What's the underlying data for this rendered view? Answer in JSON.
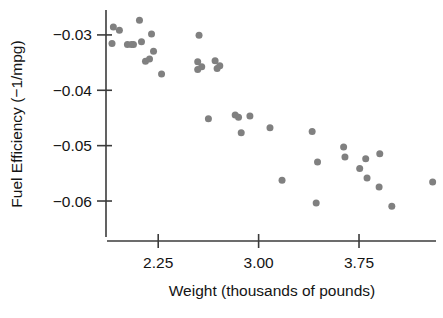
{
  "chart_data": {
    "type": "scatter",
    "title": "",
    "xlabel": "Weight (thousands of pounds)",
    "ylabel": "Fuel Efficiency (−1/mpg)",
    "xlim": [
      1.86,
      4.34
    ],
    "ylim": [
      -0.0665,
      -0.0255
    ],
    "grid": false,
    "legend": null,
    "xticks": [
      2.25,
      3.0,
      3.75
    ],
    "xtick_labels": [
      "2.25",
      "3.00",
      "3.75"
    ],
    "yticks": [
      -0.03,
      -0.04,
      -0.05,
      -0.06
    ],
    "ytick_labels": [
      "−0.03",
      "−0.04",
      "−0.05",
      "−0.06"
    ],
    "marker": {
      "shape": "circle",
      "color": "#808080",
      "size": 5.6
    },
    "points": [
      {
        "x": 1.915,
        "y": -0.02855
      },
      {
        "x": 1.96,
        "y": -0.02915
      },
      {
        "x": 2.11,
        "y": -0.02735
      },
      {
        "x": 1.905,
        "y": -0.03155
      },
      {
        "x": 2.02,
        "y": -0.03175
      },
      {
        "x": 2.065,
        "y": -0.03175
      },
      {
        "x": 2.125,
        "y": -0.03125
      },
      {
        "x": 2.2,
        "y": -0.02985
      },
      {
        "x": 2.05,
        "y": -0.03175
      },
      {
        "x": 2.155,
        "y": -0.03475
      },
      {
        "x": 2.185,
        "y": -0.03435
      },
      {
        "x": 2.215,
        "y": -0.03295
      },
      {
        "x": 2.275,
        "y": -0.03705
      },
      {
        "x": 2.555,
        "y": -0.03005
      },
      {
        "x": 2.545,
        "y": -0.03485
      },
      {
        "x": 2.545,
        "y": -0.03625
      },
      {
        "x": 2.575,
        "y": -0.03575
      },
      {
        "x": 2.675,
        "y": -0.03465
      },
      {
        "x": 2.69,
        "y": -0.03605
      },
      {
        "x": 2.71,
        "y": -0.03555
      },
      {
        "x": 2.625,
        "y": -0.04515
      },
      {
        "x": 2.825,
        "y": -0.04445
      },
      {
        "x": 2.85,
        "y": -0.04485
      },
      {
        "x": 2.935,
        "y": -0.04465
      },
      {
        "x": 2.87,
        "y": -0.04765
      },
      {
        "x": 3.085,
        "y": -0.04675
      },
      {
        "x": 3.4,
        "y": -0.04745
      },
      {
        "x": 3.635,
        "y": -0.05025
      },
      {
        "x": 3.645,
        "y": -0.05205
      },
      {
        "x": 3.44,
        "y": -0.05295
      },
      {
        "x": 3.175,
        "y": -0.05625
      },
      {
        "x": 3.755,
        "y": -0.05415
      },
      {
        "x": 3.43,
        "y": -0.06035
      },
      {
        "x": 3.8,
        "y": -0.05235
      },
      {
        "x": 3.905,
        "y": -0.05145
      },
      {
        "x": 3.81,
        "y": -0.05585
      },
      {
        "x": 3.9,
        "y": -0.05745
      },
      {
        "x": 3.995,
        "y": -0.06095
      },
      {
        "x": 4.3,
        "y": -0.05655
      }
    ]
  },
  "layout": {
    "plot_left": 106,
    "plot_right": 438,
    "plot_top": 10,
    "plot_bottom": 237,
    "x_axis_y": 241,
    "y_axis_x": 106,
    "x_axis_start": 107,
    "x_axis_end": 436,
    "tick_len": 9
  },
  "colors": {
    "point": "#808080",
    "axis": "#3b3b3b",
    "text": "#141414",
    "background": "#ffffff"
  }
}
